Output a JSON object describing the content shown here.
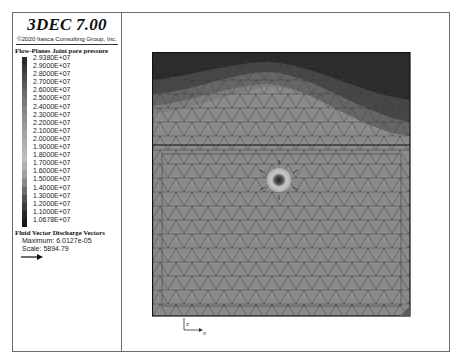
{
  "header": {
    "title": "3DEC 7.00",
    "copyright": "©2020 Itasca Consulting Group, Inc."
  },
  "legend": {
    "title": "Flow-Planes Joint pore pressure",
    "levels": [
      {
        "label": "2.9380E+07",
        "color": "#2a2a2a"
      },
      {
        "label": "2.9000E+07",
        "color": "#3a3a3a"
      },
      {
        "label": "2.8000E+07",
        "color": "#4a4a4a"
      },
      {
        "label": "2.7000E+07",
        "color": "#5a5a5a"
      },
      {
        "label": "2.6000E+07",
        "color": "#6a6a6a"
      },
      {
        "label": "2.5000E+07",
        "color": "#787878"
      },
      {
        "label": "2.4000E+07",
        "color": "#858585"
      },
      {
        "label": "2.3000E+07",
        "color": "#8f8f8f"
      },
      {
        "label": "2.2000E+07",
        "color": "#999999"
      },
      {
        "label": "2.1000E+07",
        "color": "#a3a3a3"
      },
      {
        "label": "2.0000E+07",
        "color": "#adadad"
      },
      {
        "label": "1.9000E+07",
        "color": "#b5b5b5"
      },
      {
        "label": "1.8000E+07",
        "color": "#bdbdbd"
      },
      {
        "label": "1.7000E+07",
        "color": "#b0b0b0"
      },
      {
        "label": "1.6000E+07",
        "color": "#a0a0a0"
      },
      {
        "label": "1.5000E+07",
        "color": "#8a8a8a"
      },
      {
        "label": "1.4000E+07",
        "color": "#6e6e6e"
      },
      {
        "label": "1.3000E+07",
        "color": "#525252"
      },
      {
        "label": "1.2000E+07",
        "color": "#3a3a3a"
      },
      {
        "label": "1.1000E+07",
        "color": "#282828"
      },
      {
        "label": "1.0678E+07",
        "color": "#1a1a1a"
      }
    ]
  },
  "vectors": {
    "title": "Fluid Vector Discharge Vectors",
    "maximum": "Maximum: 6.0127e-05",
    "scale": "Scale: 5894.79"
  },
  "axes": {
    "vertical": "z",
    "horizontal": "x"
  },
  "colors": {
    "band_top": "#2b2b2b",
    "band_2": "#474747",
    "band_3": "#666666",
    "band_4": "#7e7e7e",
    "lower_block": "#8a8a8a",
    "mesh_line": "#3a3a3a"
  }
}
